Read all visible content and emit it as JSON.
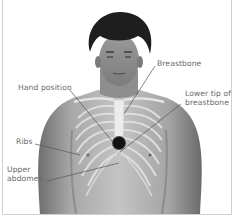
{
  "diagram": {
    "labels": {
      "breastbone": "Breastbone",
      "hand_position": "Hand position",
      "lower_tip_line1": "Lower tip of",
      "lower_tip_line2": "breastbone",
      "ribs": "Ribs",
      "upper_abdomen_line1": "Upper",
      "upper_abdomen_line2": "abdomen"
    },
    "colors": {
      "border": "#cfcfcf",
      "label_text": "#6a6a6a",
      "leader_line": "#555555",
      "hand_marker": "#111111"
    }
  }
}
